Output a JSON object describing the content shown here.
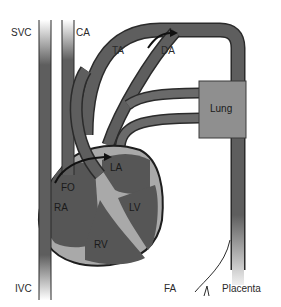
{
  "diagram": {
    "labels": {
      "svc": "SVC",
      "ca": "CA",
      "ta": "TA",
      "da": "DA",
      "lung": "Lung",
      "la": "LA",
      "fo": "FO",
      "ra": "RA",
      "lv": "LV",
      "rv": "RV",
      "ivc": "IVC",
      "fa": "FA",
      "placenta": "Placenta"
    },
    "colors": {
      "vessel": "#5e5e5e",
      "vessel_outline": "#2b2b2b",
      "heart": "#565656",
      "septum_light": "#a9a9a9",
      "lung": "#8f8f8f",
      "background": "#ffffff"
    }
  }
}
